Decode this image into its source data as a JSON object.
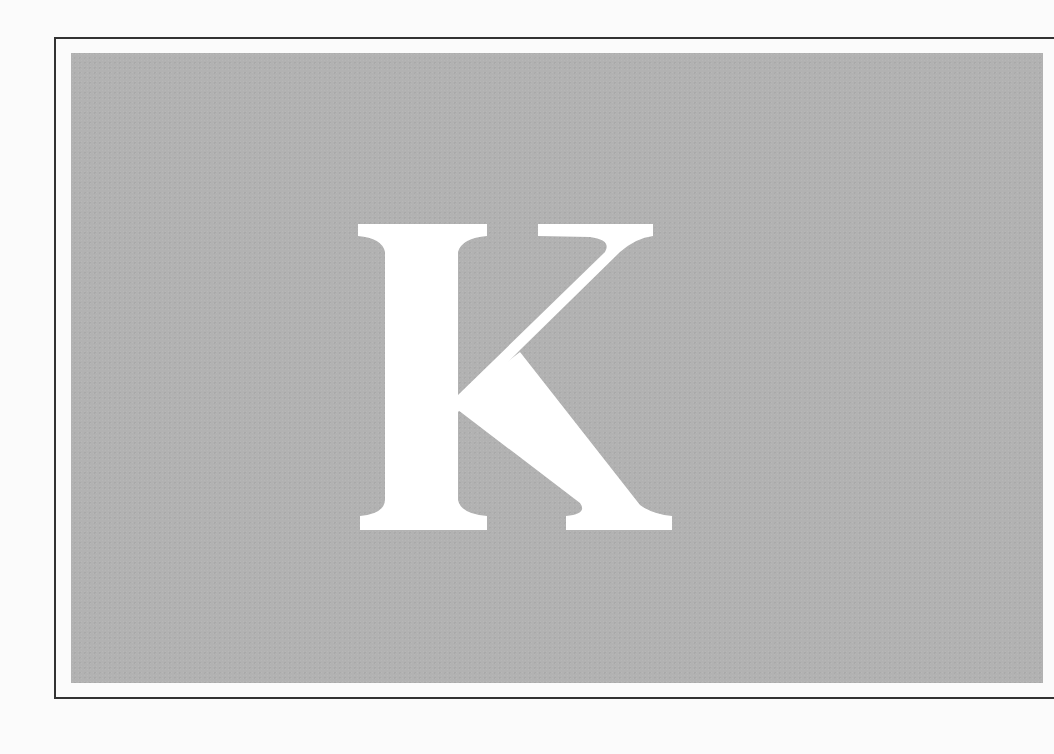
{
  "illustration": {
    "letter": "K",
    "letter_color": "#ffffff",
    "panel_color": "#b2b2b2",
    "frame_color": "#333333",
    "page_color": "#fbfbfb"
  }
}
